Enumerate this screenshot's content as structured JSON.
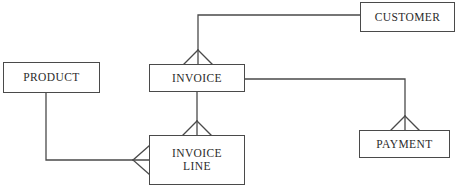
{
  "diagram": {
    "type": "entity-relationship-diagram",
    "notation": "crow's foot",
    "background_color": "#ffffff",
    "line_color": "#4a4a4a",
    "text_color": "#2b2b2b",
    "entities": [
      {
        "id": "customer",
        "label": "CUSTOMER",
        "x": 360,
        "y": 2,
        "width": 95,
        "height": 30
      },
      {
        "id": "product",
        "label": "PRODUCT",
        "x": 3,
        "y": 62,
        "width": 97,
        "height": 31
      },
      {
        "id": "invoice",
        "label": "INVOICE",
        "x": 149,
        "y": 64,
        "width": 96,
        "height": 28
      },
      {
        "id": "invoice_line",
        "label": "INVOICE\nLINE",
        "x": 149,
        "y": 135,
        "width": 96,
        "height": 50
      },
      {
        "id": "payment",
        "label": "PAYMENT",
        "x": 359,
        "y": 130,
        "width": 91,
        "height": 28
      }
    ],
    "relationships": [
      {
        "id": "customer-invoice",
        "from": "customer",
        "to": "invoice",
        "from_cardinality": "one",
        "to_cardinality": "many",
        "crowfoot_at": "invoice",
        "path": "M 360 15 L 198 15 L 198 64",
        "crowfoot": {
          "apex_x": 198,
          "apex_y": 50,
          "base_y": 64,
          "spread": 14
        }
      },
      {
        "id": "invoice-payment",
        "from": "invoice",
        "to": "payment",
        "from_cardinality": "one",
        "to_cardinality": "many",
        "crowfoot_at": "payment",
        "path": "M 245 79 L 405 79 L 405 130",
        "crowfoot": {
          "apex_x": 405,
          "apex_y": 116,
          "base_y": 130,
          "spread": 14
        }
      },
      {
        "id": "invoice-invoiceline",
        "from": "invoice",
        "to": "invoice_line",
        "from_cardinality": "one",
        "to_cardinality": "many",
        "crowfoot_at": "invoice_line",
        "path": "M 197 92 L 197 135",
        "crowfoot": {
          "apex_x": 197,
          "apex_y": 121,
          "base_y": 135,
          "spread": 14
        }
      },
      {
        "id": "product-invoiceline",
        "from": "product",
        "to": "invoice_line",
        "from_cardinality": "one",
        "to_cardinality": "many",
        "crowfoot_at": "invoice_line",
        "path": "M 46 93 L 46 160 L 149 160",
        "crowfoot": {
          "apex_x": 133,
          "apex_y": 160,
          "base_x": 149,
          "spread": 14
        }
      }
    ]
  }
}
